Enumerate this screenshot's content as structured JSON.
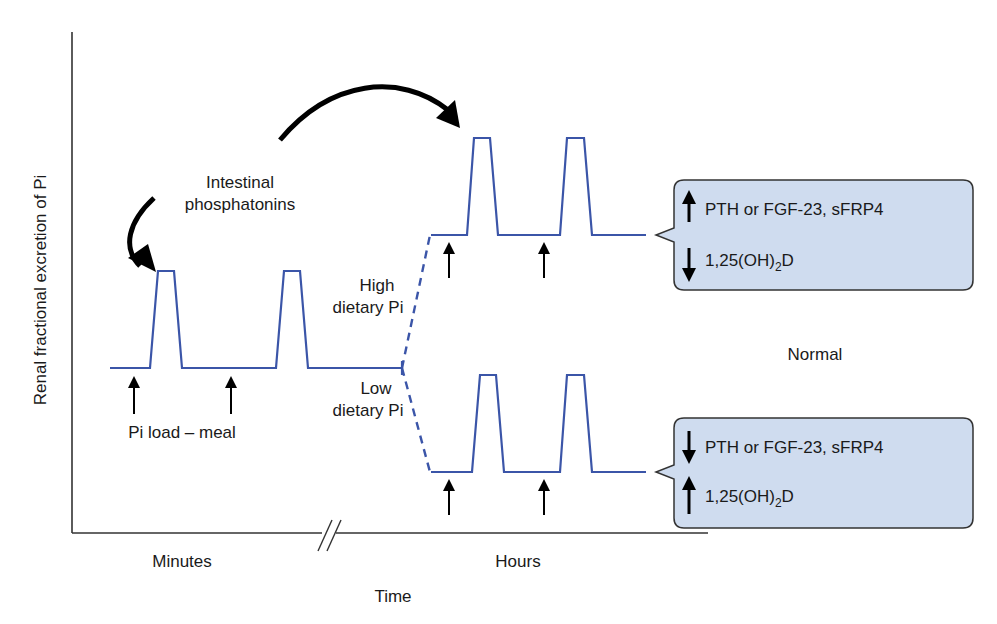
{
  "diagram": {
    "y_axis_label": "Renal fractional excretion of Pi",
    "x_axis_label": "Time",
    "x_segments": {
      "left": "Minutes",
      "right": "Hours",
      "break_mark": "//"
    },
    "annotations": {
      "phosphatonins_line1": "Intestinal",
      "phosphatonins_line2": "phosphatonins",
      "pi_load": "Pi load – meal",
      "high_line1": "High",
      "high_line2": "dietary Pi",
      "low_line1": "Low",
      "low_line2": "dietary Pi",
      "normal": "Normal"
    },
    "callouts": {
      "high": {
        "line1": {
          "direction": "up",
          "text": "PTH or FGF-23, sFRP4"
        },
        "line2": {
          "direction": "down",
          "text_main": "1,25(OH)",
          "text_sub": "2",
          "text_end": "D"
        }
      },
      "low": {
        "line1": {
          "direction": "down",
          "text": "PTH or FGF-23, sFRP4"
        },
        "line2": {
          "direction": "up",
          "text_main": "1,25(OH)",
          "text_sub": "2",
          "text_end": "D"
        }
      }
    },
    "colors": {
      "trace": "#3b55a8",
      "callout_fill": "#cfdcef",
      "axis": "#333333",
      "arrow": "#000000"
    },
    "icons": {
      "meal_arrow": "up-arrow-icon",
      "increase": "up-arrow-icon",
      "decrease": "down-arrow-icon",
      "curved_arrow": "curved-arrow-icon"
    }
  }
}
